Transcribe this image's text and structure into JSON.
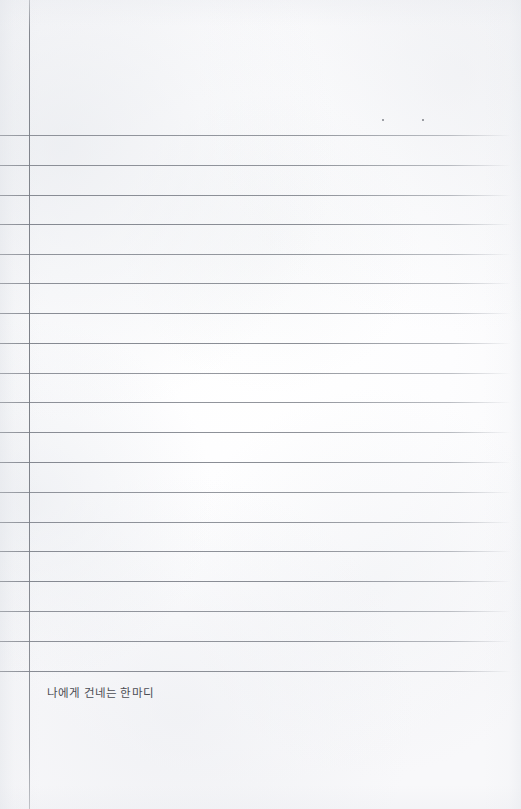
{
  "page": {
    "kind": "scanned-ruled-notebook-page",
    "width": 521,
    "height": 809,
    "paper_color": "#fdfdfd",
    "rule_color": "#7c8088",
    "margin_rule_color": "#7a7e86",
    "ink_color": "#4b4d54"
  },
  "margin_rule": {
    "label": "vertical-margin-rule",
    "x": 29,
    "top": 0,
    "height": 809
  },
  "ruling": {
    "label": "horizontal-ruled-lines",
    "count": 19,
    "first_y": 135,
    "spacing": 29.8,
    "left": 0,
    "right": 511,
    "y_positions": [
      135,
      165,
      195,
      224,
      254,
      283,
      313,
      343,
      373,
      402,
      432,
      462,
      492,
      522,
      551,
      581,
      611,
      641,
      671
    ]
  },
  "specks": [
    {
      "label": "scan-speck-left",
      "x": 382,
      "y": 119,
      "size": 2.2
    },
    {
      "label": "scan-speck-right",
      "x": 422,
      "y": 119,
      "size": 1.8
    }
  ],
  "caption": {
    "label": "handwriting-prompt-caption",
    "text": "나에게 건네는 한마디",
    "translation_note": "A word I offer to myself",
    "x": 47,
    "y": 686,
    "font_size": 11.5
  }
}
